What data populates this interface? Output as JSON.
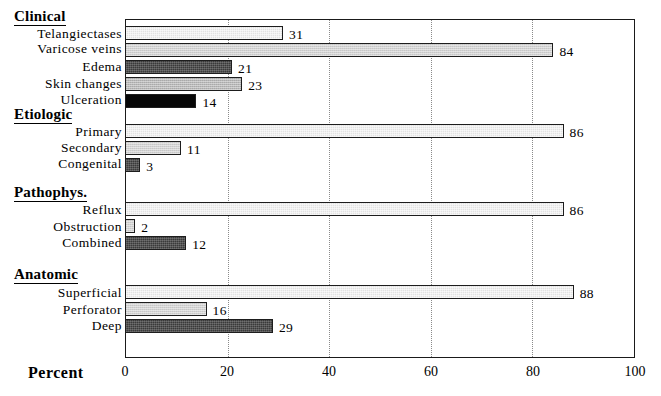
{
  "chart_data": {
    "type": "bar",
    "orientation": "horizontal",
    "title": "",
    "xlabel": "Percent",
    "ylabel": "",
    "xlim": [
      0,
      100
    ],
    "xticks": [
      0,
      20,
      40,
      60,
      80,
      100
    ],
    "grid": "vertical-dotted",
    "legend": "none",
    "groups": [
      {
        "name": "Clinical",
        "categories": [
          "Telangiectases",
          "Varicose veins",
          "Edema",
          "Skin changes",
          "Ulceration"
        ],
        "values": [
          31,
          84,
          21,
          23,
          14
        ],
        "fills": [
          "fill-light",
          "fill-lightgrey",
          "fill-dark",
          "fill-midgrey",
          "fill-black"
        ]
      },
      {
        "name": "Etiologic",
        "categories": [
          "Primary",
          "Secondary",
          "Congenital"
        ],
        "values": [
          86,
          11,
          3
        ],
        "fills": [
          "fill-light",
          "fill-lightgrey",
          "fill-dark"
        ]
      },
      {
        "name": "Pathophys.",
        "categories": [
          "Reflux",
          "Obstruction",
          "Combined"
        ],
        "values": [
          86,
          2,
          12
        ],
        "fills": [
          "fill-light",
          "fill-lightgrey",
          "fill-dark"
        ]
      },
      {
        "name": "Anatomic",
        "categories": [
          "Superficial",
          "Perforator",
          "Deep"
        ],
        "values": [
          88,
          16,
          29
        ],
        "fills": [
          "fill-light",
          "fill-lightgrey",
          "fill-dark"
        ]
      }
    ]
  },
  "axis": {
    "title": "Percent",
    "ticks": [
      "0",
      "20",
      "40",
      "60",
      "80",
      "100"
    ]
  },
  "groups": {
    "clinical": {
      "header": "Clinical",
      "rows": [
        {
          "label": "Telangiectases",
          "value": "31"
        },
        {
          "label": "Varicose veins",
          "value": "84"
        },
        {
          "label": "Edema",
          "value": "21"
        },
        {
          "label": "Skin changes",
          "value": "23"
        },
        {
          "label": "Ulceration",
          "value": "14"
        }
      ]
    },
    "etiologic": {
      "header": "Etiologic",
      "rows": [
        {
          "label": "Primary",
          "value": "86"
        },
        {
          "label": "Secondary",
          "value": "11"
        },
        {
          "label": "Congenital",
          "value": "3"
        }
      ]
    },
    "pathophys": {
      "header": "Pathophys.",
      "rows": [
        {
          "label": "Reflux",
          "value": "86"
        },
        {
          "label": "Obstruction",
          "value": "2"
        },
        {
          "label": "Combined",
          "value": "12"
        }
      ]
    },
    "anatomic": {
      "header": "Anatomic",
      "rows": [
        {
          "label": "Superficial",
          "value": "88"
        },
        {
          "label": "Perforator",
          "value": "16"
        },
        {
          "label": "Deep",
          "value": "29"
        }
      ]
    }
  },
  "colors": {
    "frame": "#1a1a1a",
    "grid": "#8a8a8a",
    "fill_light": "#e2e2e2",
    "fill_lightgrey": "#d2d2d2",
    "fill_midgrey": "#b9b9b9",
    "fill_dark": "#3a3a3a",
    "fill_black": "#070707",
    "text": "#000000",
    "background": "#ffffff"
  }
}
